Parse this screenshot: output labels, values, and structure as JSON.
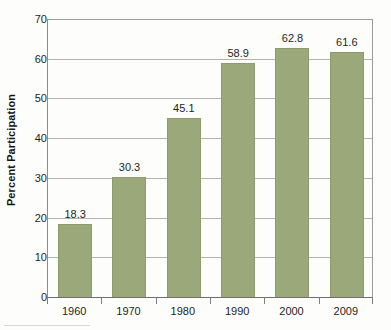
{
  "chart_data": {
    "type": "bar",
    "title": "",
    "subtitle": "",
    "xlabel": "",
    "ylabel": "Percent Participation",
    "categories": [
      "1960",
      "1970",
      "1980",
      "1990",
      "2000",
      "2009"
    ],
    "values": [
      18.3,
      30.3,
      45.1,
      58.9,
      62.8,
      61.6
    ],
    "value_labels": [
      "18.3",
      "30.3",
      "45.1",
      "58.9",
      "62.8",
      "61.6"
    ],
    "ylim": [
      0,
      70
    ],
    "ytick_values": [
      0,
      10,
      20,
      30,
      40,
      50,
      60,
      70
    ],
    "ytick_labels": [
      "0",
      "10",
      "20",
      "30",
      "40",
      "50",
      "60",
      "70"
    ],
    "grid": true,
    "grid_axis": "y",
    "legend": false,
    "legend_position": "none",
    "series": [
      {
        "name": "Percent Participation",
        "values": [
          18.3,
          30.3,
          45.1,
          58.9,
          62.8,
          61.6
        ]
      }
    ],
    "colors": {
      "bar_fill": "#9aa87a",
      "bar_border": "#8d9b6d",
      "gridline": "#b3b3ad",
      "axis": "#7d7d7d",
      "text": "#1d1d1d",
      "background": "#fdfdfc"
    }
  }
}
